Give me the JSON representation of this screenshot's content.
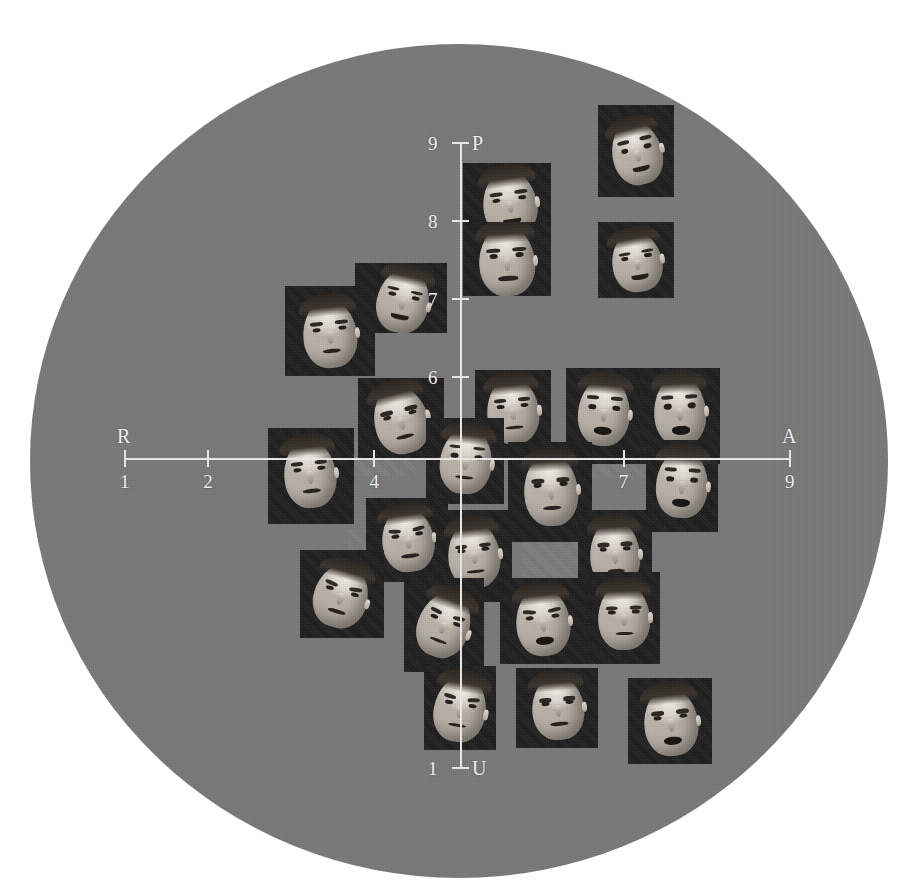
{
  "figure": {
    "title": "",
    "background_color": "#ffffff",
    "field_color": "#787878",
    "card_color": "#1a1a1a",
    "axis_color": "#e9e9e9",
    "label_color": "#f2f2f2"
  },
  "axes": {
    "horizontal": {
      "left_label": "R",
      "right_label": "A",
      "ticks": [
        {
          "label": "1",
          "value": 1
        },
        {
          "label": "2",
          "value": 2
        },
        {
          "label": "4",
          "value": 4
        },
        {
          "label": "7",
          "value": 7
        },
        {
          "label": "9",
          "value": 9
        }
      ]
    },
    "vertical": {
      "top_label": "P",
      "bottom_label": "U",
      "ticks": [
        {
          "label": "9",
          "value": 9
        },
        {
          "label": "8",
          "value": 8
        },
        {
          "label": "7",
          "value": 7
        },
        {
          "label": "6",
          "value": 6
        },
        {
          "label": "1",
          "value": 1
        }
      ]
    }
  },
  "chart_data": {
    "type": "scatter",
    "title": "",
    "subtitle": "",
    "xlabel": "R — A",
    "ylabel": "P — U",
    "xlim": [
      1,
      9
    ],
    "ylim": [
      1,
      9
    ],
    "xticks": [
      1,
      2,
      4,
      7,
      9
    ],
    "yticks": [
      1,
      6,
      7,
      8,
      9
    ],
    "xtick_labels": [
      "1",
      "2",
      "4",
      "7",
      "9"
    ],
    "ytick_labels": [
      "1",
      "6",
      "7",
      "8",
      "9"
    ],
    "grid": false,
    "legend": "none",
    "point_marker": "photograph",
    "annotations": [
      {
        "text": "R",
        "position": "x-axis-left-end"
      },
      {
        "text": "A",
        "position": "x-axis-right-end"
      },
      {
        "text": "P",
        "position": "y-axis-top-end"
      },
      {
        "text": "U",
        "position": "y-axis-bottom-end"
      }
    ],
    "points": [
      {
        "id": "f01",
        "x": 7.95,
        "y": 9.3,
        "expression": "laughing",
        "has_photo": true
      },
      {
        "id": "f02",
        "x": 6.45,
        "y": 8.55,
        "expression": "grinning",
        "has_photo": true
      },
      {
        "id": "f03",
        "x": 6.45,
        "y": 7.55,
        "expression": "smiling",
        "has_photo": true
      },
      {
        "id": "f04",
        "x": 7.95,
        "y": 7.85,
        "expression": "amused",
        "has_photo": true
      },
      {
        "id": "f05",
        "x": 3.05,
        "y": 6.95,
        "expression": "wry-smile",
        "has_photo": true
      },
      {
        "id": "f06",
        "x": 2.35,
        "y": 6.35,
        "expression": "pensive",
        "has_photo": true
      },
      {
        "id": "f07",
        "x": 5.65,
        "y": 6.15,
        "expression": "attentive",
        "has_photo": true
      },
      {
        "id": "f08",
        "x": 4.05,
        "y": 5.55,
        "expression": "frowning",
        "has_photo": true
      },
      {
        "id": "f09",
        "x": 7.05,
        "y": 5.85,
        "expression": "astonished",
        "has_photo": true
      },
      {
        "id": "f10",
        "x": 8.05,
        "y": 5.85,
        "expression": "aghast",
        "has_photo": true
      },
      {
        "id": "f11",
        "x": 2.85,
        "y": 4.8,
        "expression": "dubious",
        "has_photo": true
      },
      {
        "id": "f12",
        "x": 5.05,
        "y": 4.8,
        "expression": "gazing-up",
        "has_photo": true
      },
      {
        "id": "f13",
        "x": 6.15,
        "y": 4.45,
        "expression": "stern",
        "has_photo": true
      },
      {
        "id": "f14",
        "x": 8.15,
        "y": 4.3,
        "expression": "startled",
        "has_photo": true
      },
      {
        "id": "f15",
        "x": 3.95,
        "y": 3.75,
        "expression": "worried",
        "has_photo": true
      },
      {
        "id": "f16",
        "x": 3.15,
        "y": 3.1,
        "expression": "downcast",
        "has_photo": true
      },
      {
        "id": "f17",
        "x": 5.05,
        "y": 3.5,
        "expression": "determined",
        "has_photo": true
      },
      {
        "id": "f18",
        "x": 6.95,
        "y": 3.35,
        "expression": "glum",
        "has_photo": true
      },
      {
        "id": "f19",
        "x": 4.75,
        "y": 2.55,
        "expression": "pained",
        "has_photo": true
      },
      {
        "id": "f20",
        "x": 5.95,
        "y": 2.45,
        "expression": "anguished",
        "has_photo": true
      },
      {
        "id": "f21",
        "x": 7.05,
        "y": 2.5,
        "expression": "grim",
        "has_photo": true
      },
      {
        "id": "f22",
        "x": 5.05,
        "y": 1.6,
        "expression": "distressed",
        "has_photo": true
      },
      {
        "id": "f23",
        "x": 6.35,
        "y": 1.5,
        "expression": "disgusted",
        "has_photo": true
      },
      {
        "id": "f24",
        "x": 7.85,
        "y": 1.35,
        "expression": "enraged",
        "has_photo": true
      },
      {
        "id": "f25",
        "x": 5.95,
        "y": 4.05,
        "expression": "none",
        "has_photo": false
      },
      {
        "id": "f26",
        "x": 7.05,
        "y": 4.55,
        "expression": "none",
        "has_photo": false
      },
      {
        "id": "f27",
        "x": 4.25,
        "y": 4.55,
        "expression": "none",
        "has_photo": false
      },
      {
        "id": "f28",
        "x": 4.25,
        "y": 3.4,
        "expression": "none",
        "has_photo": false
      }
    ]
  },
  "cards": [
    {
      "name": "photo-card-laughing",
      "left": 598,
      "top": 105,
      "width": 76,
      "height": 92,
      "blank": false,
      "face": {
        "left": 14,
        "top": 16,
        "width": 50,
        "height": 64,
        "rot": -14,
        "mouth": "smile",
        "brows": "raised",
        "ears": "r"
      }
    },
    {
      "name": "photo-card-grinning",
      "left": 463,
      "top": 163,
      "width": 88,
      "height": 78,
      "blank": false,
      "face": {
        "left": 20,
        "top": 8,
        "width": 54,
        "height": 66,
        "rot": -8,
        "mouth": "smile",
        "brows": "flat",
        "ears": "r"
      }
    },
    {
      "name": "photo-card-smiling",
      "left": 463,
      "top": 222,
      "width": 88,
      "height": 74,
      "blank": false,
      "face": {
        "left": 16,
        "top": 4,
        "width": 56,
        "height": 70,
        "rot": -4,
        "mouth": "plain",
        "brows": "flat",
        "ears": "r"
      }
    },
    {
      "name": "photo-card-amused",
      "left": 598,
      "top": 222,
      "width": 76,
      "height": 76,
      "blank": false,
      "face": {
        "left": 14,
        "top": 10,
        "width": 50,
        "height": 60,
        "rot": -10,
        "mouth": "smile",
        "brows": "flat",
        "ears": "r"
      }
    },
    {
      "name": "photo-card-wry-smile",
      "left": 355,
      "top": 263,
      "width": 92,
      "height": 70,
      "blank": false,
      "face": {
        "left": 22,
        "top": 6,
        "width": 52,
        "height": 64,
        "rot": 12,
        "mouth": "smile",
        "brows": "flat",
        "ears": "r"
      }
    },
    {
      "name": "photo-card-pensive",
      "left": 285,
      "top": 286,
      "width": 90,
      "height": 90,
      "blank": false,
      "face": {
        "left": 18,
        "top": 14,
        "width": 54,
        "height": 68,
        "rot": -6,
        "mouth": "plain",
        "brows": "flat",
        "ears": "r"
      }
    },
    {
      "name": "photo-card-attentive",
      "left": 475,
      "top": 370,
      "width": 76,
      "height": 88,
      "blank": false,
      "face": {
        "left": 12,
        "top": 8,
        "width": 52,
        "height": 66,
        "rot": -5,
        "mouth": "plain",
        "brows": "flat",
        "ears": "r"
      }
    },
    {
      "name": "photo-card-frowning",
      "left": 358,
      "top": 378,
      "width": 86,
      "height": 82,
      "blank": false,
      "face": {
        "left": 16,
        "top": 8,
        "width": 54,
        "height": 68,
        "rot": -14,
        "mouth": "plain",
        "brows": "furrowed",
        "ears": "r"
      }
    },
    {
      "name": "photo-card-astonished",
      "left": 566,
      "top": 368,
      "width": 76,
      "height": 96,
      "blank": false,
      "face": {
        "left": 12,
        "top": 10,
        "width": 52,
        "height": 68,
        "rot": 4,
        "mouth": "open",
        "brows": "raised",
        "ears": "r"
      }
    },
    {
      "name": "photo-card-aghast",
      "left": 640,
      "top": 368,
      "width": 80,
      "height": 96,
      "blank": false,
      "face": {
        "left": 14,
        "top": 8,
        "width": 52,
        "height": 70,
        "rot": -3,
        "mouth": "open",
        "brows": "raised",
        "ears": "r"
      }
    },
    {
      "name": "photo-card-dubious",
      "left": 268,
      "top": 428,
      "width": 86,
      "height": 96,
      "blank": false,
      "face": {
        "left": 16,
        "top": 12,
        "width": 52,
        "height": 68,
        "rot": -6,
        "mouth": "plain",
        "brows": "flat",
        "ears": "r"
      }
    },
    {
      "name": "photo-card-gazing-up",
      "left": 426,
      "top": 418,
      "width": 78,
      "height": 86,
      "blank": false,
      "face": {
        "left": 14,
        "top": 10,
        "width": 52,
        "height": 66,
        "rot": 6,
        "mouth": "plain",
        "brows": "raised",
        "ears": "r"
      }
    },
    {
      "name": "photo-card-stern",
      "left": 508,
      "top": 442,
      "width": 84,
      "height": 100,
      "blank": false,
      "face": {
        "left": 16,
        "top": 12,
        "width": 54,
        "height": 72,
        "rot": -4,
        "mouth": "plain",
        "brows": "furrowed",
        "ears": "r"
      }
    },
    {
      "name": "photo-card-startled",
      "left": 646,
      "top": 440,
      "width": 72,
      "height": 92,
      "blank": false,
      "face": {
        "left": 10,
        "top": 10,
        "width": 52,
        "height": 68,
        "rot": 3,
        "mouth": "open",
        "brows": "raised",
        "ears": "r"
      }
    },
    {
      "name": "photo-card-worried",
      "left": 366,
      "top": 498,
      "width": 82,
      "height": 84,
      "blank": false,
      "face": {
        "left": 16,
        "top": 10,
        "width": 52,
        "height": 64,
        "rot": -8,
        "mouth": "plain",
        "brows": "worried",
        "ears": "r"
      }
    },
    {
      "name": "photo-card-downcast",
      "left": 300,
      "top": 550,
      "width": 84,
      "height": 88,
      "blank": false,
      "face": {
        "left": 14,
        "top": 14,
        "width": 54,
        "height": 64,
        "rot": 16,
        "mouth": "plain",
        "brows": "worried",
        "ears": "r"
      }
    },
    {
      "name": "photo-card-determined",
      "left": 436,
      "top": 510,
      "width": 76,
      "height": 92,
      "blank": false,
      "face": {
        "left": 12,
        "top": 12,
        "width": 52,
        "height": 66,
        "rot": -6,
        "mouth": "plain",
        "brows": "furrowed",
        "ears": "r"
      }
    },
    {
      "name": "photo-card-glum",
      "left": 578,
      "top": 510,
      "width": 74,
      "height": 92,
      "blank": false,
      "face": {
        "left": 12,
        "top": 10,
        "width": 50,
        "height": 68,
        "rot": -3,
        "mouth": "plain",
        "brows": "furrowed",
        "ears": "r"
      }
    },
    {
      "name": "photo-card-pained",
      "left": 404,
      "top": 578,
      "width": 80,
      "height": 94,
      "blank": false,
      "face": {
        "left": 14,
        "top": 14,
        "width": 52,
        "height": 66,
        "rot": 20,
        "mouth": "plain",
        "brows": "worried",
        "ears": "r"
      }
    },
    {
      "name": "photo-card-anguished",
      "left": 500,
      "top": 578,
      "width": 88,
      "height": 86,
      "blank": false,
      "face": {
        "left": 16,
        "top": 10,
        "width": 54,
        "height": 68,
        "rot": -6,
        "mouth": "open",
        "brows": "worried",
        "ears": "r"
      }
    },
    {
      "name": "photo-card-grim",
      "left": 588,
      "top": 572,
      "width": 72,
      "height": 92,
      "blank": false,
      "face": {
        "left": 10,
        "top": 12,
        "width": 52,
        "height": 66,
        "rot": -2,
        "mouth": "plain",
        "brows": "furrowed",
        "ears": "r"
      }
    },
    {
      "name": "photo-card-distressed",
      "left": 424,
      "top": 666,
      "width": 72,
      "height": 84,
      "blank": false,
      "face": {
        "left": 10,
        "top": 10,
        "width": 52,
        "height": 66,
        "rot": 10,
        "mouth": "plain",
        "brows": "worried",
        "ears": "r"
      }
    },
    {
      "name": "photo-card-disgusted",
      "left": 516,
      "top": 668,
      "width": 82,
      "height": 80,
      "blank": false,
      "face": {
        "left": 16,
        "top": 8,
        "width": 52,
        "height": 64,
        "rot": -5,
        "mouth": "plain",
        "brows": "furrowed",
        "ears": "r"
      }
    },
    {
      "name": "photo-card-enraged",
      "left": 628,
      "top": 678,
      "width": 84,
      "height": 86,
      "blank": false,
      "face": {
        "left": 16,
        "top": 10,
        "width": 54,
        "height": 68,
        "rot": -6,
        "mouth": "open",
        "brows": "furrowed",
        "ears": "r"
      }
    },
    {
      "name": "photo-card-blank-a",
      "left": 522,
      "top": 512,
      "width": 56,
      "height": 66,
      "blank": true,
      "face": null
    },
    {
      "name": "photo-card-blank-b",
      "left": 592,
      "top": 442,
      "width": 64,
      "height": 36,
      "blank": true,
      "face": null
    },
    {
      "name": "photo-card-blank-c",
      "left": 350,
      "top": 442,
      "width": 66,
      "height": 34,
      "blank": true,
      "face": null
    },
    {
      "name": "photo-card-blank-d",
      "left": 348,
      "top": 530,
      "width": 58,
      "height": 52,
      "blank": true,
      "face": null
    }
  ]
}
